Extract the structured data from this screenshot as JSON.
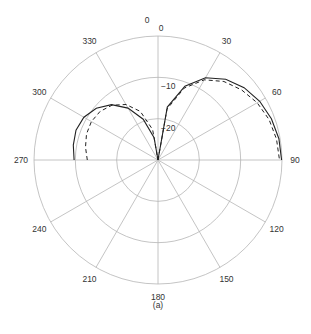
{
  "chart_data": {
    "type": "polar-line",
    "title": "",
    "caption": "(a)",
    "angle_ticks": [
      "0",
      "30",
      "60",
      "90",
      "120",
      "150",
      "180",
      "210",
      "240",
      "270",
      "300",
      "330"
    ],
    "radial_ticks": [
      "0",
      "-10",
      "-20"
    ],
    "radial_range_db": [
      -30,
      0
    ],
    "series": [
      {
        "name": "solid",
        "style": "solid",
        "points": [
          [
            0,
            -30
          ],
          [
            10,
            -17
          ],
          [
            20,
            -11
          ],
          [
            30,
            -7
          ],
          [
            40,
            -4.5
          ],
          [
            50,
            -2.8
          ],
          [
            60,
            -1.6
          ],
          [
            70,
            -0.8
          ],
          [
            80,
            -0.3
          ],
          [
            90,
            -0.1
          ],
          [
            270,
            -9.7
          ],
          [
            280,
            -9.2
          ],
          [
            290,
            -8.9
          ],
          [
            300,
            -9.3
          ],
          [
            310,
            -10.5
          ],
          [
            320,
            -12.5
          ],
          [
            330,
            -15.5
          ],
          [
            340,
            -19.5
          ],
          [
            350,
            -24.5
          ],
          [
            360,
            -30
          ]
        ]
      },
      {
        "name": "dashed",
        "style": "dashed",
        "points": [
          [
            0,
            -30
          ],
          [
            10,
            -17.5
          ],
          [
            20,
            -11.5
          ],
          [
            30,
            -7.6
          ],
          [
            40,
            -5.2
          ],
          [
            50,
            -3.6
          ],
          [
            60,
            -2.3
          ],
          [
            70,
            -1.4
          ],
          [
            80,
            -0.9
          ],
          [
            90,
            -0.6
          ],
          [
            270,
            -12.9
          ],
          [
            280,
            -12.2
          ],
          [
            290,
            -11.6
          ],
          [
            300,
            -11.4
          ],
          [
            310,
            -11.7
          ],
          [
            320,
            -12.7
          ],
          [
            330,
            -14.5
          ],
          [
            340,
            -17.5
          ],
          [
            350,
            -22.5
          ],
          [
            360,
            -30
          ]
        ]
      }
    ]
  },
  "labels": {
    "top_zero": "0",
    "caption": "(a)"
  }
}
